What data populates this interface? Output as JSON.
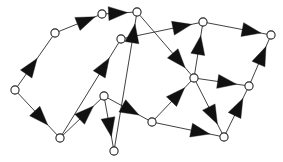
{
  "figure": {
    "type": "directed-graph",
    "width": 283,
    "height": 162,
    "background_color": "#ffffff",
    "edge_color": "#2b2b2b",
    "arrow_color": "#111111",
    "node_fill_color": "#ffffff",
    "node_stroke_color": "#242424",
    "node_radius": 4.1,
    "edge_stroke_width": 0.9,
    "arrowhead_length": 19,
    "arrowhead_halfwidth": 7
  },
  "graph_data": {
    "directed": true,
    "node_count": 12,
    "edge_count": 18,
    "nodes": [
      {
        "id": "n1",
        "label": "",
        "x": 55,
        "y": 33
      },
      {
        "id": "n2",
        "label": "",
        "x": 102,
        "y": 14
      },
      {
        "id": "n3",
        "label": "",
        "x": 137,
        "y": 12
      },
      {
        "id": "n4",
        "label": "",
        "x": 121,
        "y": 39
      },
      {
        "id": "n5",
        "label": "",
        "x": 203,
        "y": 22
      },
      {
        "id": "n6",
        "label": "",
        "x": 271,
        "y": 35
      },
      {
        "id": "n7",
        "label": "",
        "x": 15,
        "y": 90
      },
      {
        "id": "n8",
        "label": "",
        "x": 194,
        "y": 78
      },
      {
        "id": "n9",
        "label": "",
        "x": 249,
        "y": 86
      },
      {
        "id": "n10",
        "label": "",
        "x": 104,
        "y": 96
      },
      {
        "id": "n11",
        "label": "",
        "x": 60,
        "y": 138
      },
      {
        "id": "n12",
        "label": "",
        "x": 152,
        "y": 122
      },
      {
        "id": "n13",
        "label": "",
        "x": 114,
        "y": 151
      },
      {
        "id": "n14",
        "label": "",
        "x": 224,
        "y": 137
      }
    ],
    "edges": [
      {
        "id": "e1",
        "from": "n7",
        "to": "n1",
        "arrow_t": 0.56
      },
      {
        "id": "e2",
        "from": "n1",
        "to": "n2",
        "arrow_t": 0.92
      },
      {
        "id": "e3",
        "from": "n2",
        "to": "n3",
        "arrow_t": 0.8
      },
      {
        "id": "e4",
        "from": "n7",
        "to": "n11",
        "arrow_t": 0.76
      },
      {
        "id": "e5",
        "from": "n11",
        "to": "n4",
        "arrow_t": 0.83
      },
      {
        "id": "e6",
        "from": "n11",
        "to": "n10",
        "arrow_t": 0.8
      },
      {
        "id": "e7",
        "from": "n13",
        "to": "n3",
        "arrow_t": 0.94
      },
      {
        "id": "e8",
        "from": "n10",
        "to": "n13",
        "arrow_t": 0.78
      },
      {
        "id": "e9",
        "from": "n10",
        "to": "n12",
        "arrow_t": 0.77
      },
      {
        "id": "e10",
        "from": "n4",
        "to": "n5",
        "arrow_t": 0.9
      },
      {
        "id": "e11",
        "from": "n3",
        "to": "n8",
        "arrow_t": 0.88
      },
      {
        "id": "e12",
        "from": "n5",
        "to": "n6",
        "arrow_t": 0.9
      },
      {
        "id": "e13",
        "from": "n8",
        "to": "n5",
        "arrow_t": 0.8
      },
      {
        "id": "e14",
        "from": "n8",
        "to": "n9",
        "arrow_t": 0.82
      },
      {
        "id": "e15",
        "from": "n12",
        "to": "n8",
        "arrow_t": 0.82
      },
      {
        "id": "e16",
        "from": "n8",
        "to": "n14",
        "arrow_t": 0.82
      },
      {
        "id": "e17",
        "from": "n12",
        "to": "n14",
        "arrow_t": 0.84
      },
      {
        "id": "e18",
        "from": "n14",
        "to": "n9",
        "arrow_t": 0.8
      },
      {
        "id": "e19",
        "from": "n9",
        "to": "n6",
        "arrow_t": 0.82
      }
    ]
  }
}
